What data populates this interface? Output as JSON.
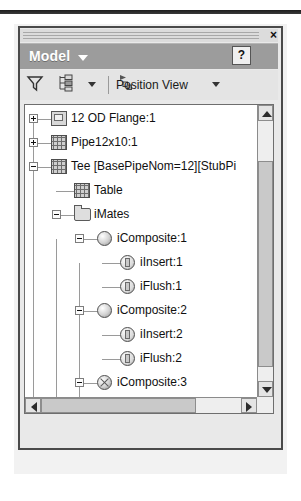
{
  "window": {
    "close_label": "×",
    "title": "Model",
    "help_label": "?"
  },
  "toolbar": {
    "filter_icon": "funnel-filter-icon",
    "tree_view_icon": "tree-hierarchy-icon",
    "position_view_label": "Position View",
    "position_view_icon": "position-view-icon"
  },
  "tree": {
    "items": [
      {
        "label": "12 OD Flange:1",
        "depth": 0,
        "expander": "plus",
        "icon": "part-box-icon"
      },
      {
        "label": "Pipe12x10:1",
        "depth": 0,
        "expander": "plus",
        "icon": "assembly-grid-icon"
      },
      {
        "label": "Tee [BasePipeNom=12][StubPi",
        "depth": 0,
        "expander": "minus",
        "icon": "assembly-grid-icon"
      },
      {
        "label": "Table",
        "depth": 1,
        "expander": "none",
        "icon": "table-grid-icon"
      },
      {
        "label": "iMates",
        "depth": 1,
        "expander": "minus",
        "icon": "folder-icon"
      },
      {
        "label": "iComposite:1",
        "depth": 2,
        "expander": "minus",
        "icon": "sphere-icon"
      },
      {
        "label": "iInsert:1",
        "depth": 3,
        "expander": "none",
        "icon": "imate-icon"
      },
      {
        "label": "iFlush:1",
        "depth": 3,
        "expander": "none",
        "icon": "imate-icon"
      },
      {
        "label": "iComposite:2",
        "depth": 2,
        "expander": "minus",
        "icon": "sphere-icon"
      },
      {
        "label": "iInsert:2",
        "depth": 3,
        "expander": "none",
        "icon": "imate-icon"
      },
      {
        "label": "iFlush:2",
        "depth": 3,
        "expander": "none",
        "icon": "imate-icon"
      },
      {
        "label": "iComposite:3",
        "depth": 2,
        "expander": "minus",
        "icon": "sphere-suppressed-icon"
      },
      {
        "label": "iFlush:3",
        "depth": 3,
        "expander": "none",
        "icon": "imate-icon"
      },
      {
        "label": "iInsert:3",
        "depth": 3,
        "expander": "none",
        "icon": "imate-icon"
      },
      {
        "label": "Origin",
        "depth": 1,
        "expander": "plus",
        "icon": "folder-icon"
      }
    ]
  },
  "scrollbars": {
    "vertical": {
      "up_arrow": "scroll-up-arrow",
      "down_arrow": "scroll-down-arrow"
    },
    "horizontal": {
      "left_arrow": "scroll-left-arrow",
      "right_arrow": "scroll-right-arrow"
    }
  },
  "colors": {
    "titlebar": "#9c9c9c",
    "panel_border": "#4a4a4a",
    "tree_background": "#ffffff",
    "scroll_thumb": "#c9c9c9"
  }
}
